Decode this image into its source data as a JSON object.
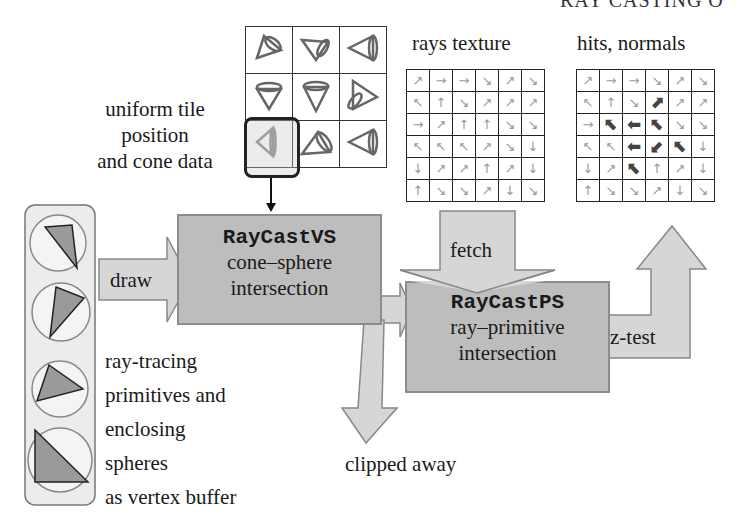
{
  "header": {
    "title": "RAY CASTING O"
  },
  "uniform_label": {
    "lines": [
      "uniform tile",
      "position",
      "and cone data"
    ]
  },
  "cone_tiles": {
    "rows": [
      [
        "cone-tile-right-up",
        "cone-tile-down-right",
        "cone-tile-left"
      ],
      [
        "cone-tile-down",
        "cone-tile-down",
        "cone-tile-right"
      ],
      [
        "cone-tile-left-selected",
        "cone-tile-up-right",
        "cone-tile-left"
      ]
    ],
    "selected": {
      "row": 2,
      "col": 0
    }
  },
  "rays_texture": {
    "title": "rays texture",
    "rows": [
      [
        "↗",
        "→",
        "→",
        "↘",
        "↗",
        "↘"
      ],
      [
        "↖",
        "↑",
        "↘",
        "↗",
        "↗",
        "↗"
      ],
      [
        "→",
        "↗",
        "↑",
        "↑",
        "↘",
        "↘"
      ],
      [
        "↖",
        "↖",
        "↖",
        "↗",
        "↘",
        "↓"
      ],
      [
        "↓",
        "↗",
        "↗",
        "↑",
        "↗",
        "↓"
      ],
      [
        "↑",
        "↘",
        "↘",
        "↗",
        "↓",
        "↘"
      ]
    ]
  },
  "hits_normals": {
    "title": "hits, normals",
    "rows": [
      [
        "↗",
        "→",
        "→",
        "↘",
        "↗",
        "↘"
      ],
      [
        "↖",
        "↑",
        "↘",
        "⬈",
        "↗",
        "↗"
      ],
      [
        "→",
        "⬉",
        "⬅",
        "⬉",
        "↘",
        "↘"
      ],
      [
        "↖",
        "↖",
        "⬅",
        "⬋",
        "⬉",
        "↓"
      ],
      [
        "↓",
        "↗",
        "⬉",
        "↑",
        "↗",
        "↓"
      ],
      [
        "↑",
        "↘",
        "↘",
        "↗",
        "↓",
        "↘"
      ]
    ],
    "hit_cells": [
      [
        1,
        3
      ],
      [
        2,
        1
      ],
      [
        2,
        2
      ],
      [
        2,
        3
      ],
      [
        3,
        2
      ],
      [
        3,
        3
      ],
      [
        3,
        4
      ],
      [
        4,
        2
      ]
    ]
  },
  "vertex_shader": {
    "name": "RayCastVS",
    "desc": [
      "cone–sphere",
      "intersection"
    ]
  },
  "pixel_shader": {
    "name": "RayCastPS",
    "desc": [
      "ray–primitive",
      "intersection"
    ]
  },
  "arrows": {
    "draw": "draw",
    "fetch": "fetch",
    "z_test": "z-test",
    "clipped": "clipped away"
  },
  "primitives_label": {
    "lines": [
      "ray-tracing",
      "primitives and",
      "enclosing",
      "spheres",
      "as vertex buffer"
    ]
  },
  "colors": {
    "box_fill": "#bdbdbd",
    "arrow_fill": "#d6d6d6",
    "panel_fill": "#ececec",
    "tri_fill": "#9a9a9a",
    "grid_line": "#222222"
  }
}
